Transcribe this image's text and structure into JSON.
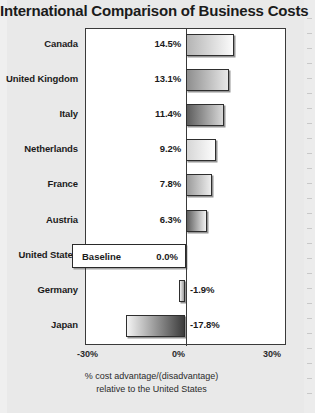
{
  "title": "International Comparison of Business Costs",
  "axis": {
    "ticks": [
      "-30%",
      "0%",
      "30%"
    ],
    "caption_line1": "% cost advantage/(disadvantage)",
    "caption_line2": "relative to the United States"
  },
  "baseline_row": {
    "label": "United States",
    "text": "Baseline",
    "value_label": "0.0%"
  },
  "chart_data": {
    "type": "bar",
    "orientation": "horizontal",
    "title": "International Comparison of Business Costs",
    "xlabel": "% cost advantage/(disadvantage) relative to the United States",
    "ylabel": "",
    "xlim": [
      -30,
      30
    ],
    "xticks": [
      -30,
      0,
      30
    ],
    "xticklabels": [
      "-30%",
      "0%",
      "30%"
    ],
    "grid": false,
    "legend": "none",
    "baseline": 0,
    "categories": [
      "Canada",
      "United Kingdom",
      "Italy",
      "Netherlands",
      "France",
      "Austria",
      "United States",
      "Germany",
      "Japan"
    ],
    "values": [
      14.5,
      13.1,
      11.4,
      9.2,
      7.8,
      6.3,
      0.0,
      -1.9,
      -17.8
    ],
    "value_labels": [
      "14.5%",
      "13.1%",
      "11.4%",
      "9.2%",
      "7.8%",
      "6.3%",
      "0.0%",
      "-1.9%",
      "-17.8%"
    ],
    "bars": [
      {
        "category": "Canada",
        "value": 14.5,
        "value_label": "14.5%",
        "fill_start": "#b4b4b4",
        "fill_end": "#fbfbfb"
      },
      {
        "category": "United Kingdom",
        "value": 13.1,
        "value_label": "13.1%",
        "fill_start": "#8e8e8e",
        "fill_end": "#e8e8e8"
      },
      {
        "category": "Italy",
        "value": 11.4,
        "value_label": "11.4%",
        "fill_start": "#5c5c5c",
        "fill_end": "#d8d8d8"
      },
      {
        "category": "Netherlands",
        "value": 9.2,
        "value_label": "9.2%",
        "fill_start": "#d6d6d6",
        "fill_end": "#fdfdfd"
      },
      {
        "category": "France",
        "value": 7.8,
        "value_label": "7.8%",
        "fill_start": "#9a9a9a",
        "fill_end": "#ededed"
      },
      {
        "category": "Austria",
        "value": 6.3,
        "value_label": "6.3%",
        "fill_start": "#5e5e5e",
        "fill_end": "#f2f2f2"
      },
      {
        "category": "United States",
        "value": 0.0,
        "value_label": "0.0%",
        "fill_start": "#ffffff",
        "fill_end": "#ffffff"
      },
      {
        "category": "Germany",
        "value": -1.9,
        "value_label": "-1.9%",
        "fill_start": "#f0f0f0",
        "fill_end": "#9e9e9e"
      },
      {
        "category": "Japan",
        "value": -17.8,
        "value_label": "-17.8%",
        "fill_start": "#f4f4f4",
        "fill_end": "#3c3c3c"
      }
    ]
  }
}
